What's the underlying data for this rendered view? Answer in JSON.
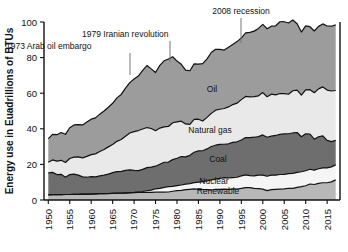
{
  "chart_data": {
    "type": "area",
    "stacked": true,
    "title": "",
    "xlabel": "",
    "ylabel": "Energy use in Euadrillions of BTUs",
    "xlim": [
      1949,
      2018
    ],
    "ylim": [
      0,
      100
    ],
    "yticks": [
      0,
      20,
      40,
      60,
      80,
      100
    ],
    "xticks": [
      1950,
      1955,
      1960,
      1965,
      1970,
      1975,
      1980,
      1985,
      1990,
      1995,
      2000,
      2005,
      2010,
      2015
    ],
    "grid": false,
    "legend_position": "inline-labels",
    "x": [
      1950,
      1951,
      1952,
      1953,
      1954,
      1955,
      1956,
      1957,
      1958,
      1959,
      1960,
      1961,
      1962,
      1963,
      1964,
      1965,
      1966,
      1967,
      1968,
      1969,
      1970,
      1971,
      1972,
      1973,
      1974,
      1975,
      1976,
      1977,
      1978,
      1979,
      1980,
      1981,
      1982,
      1983,
      1984,
      1985,
      1986,
      1987,
      1988,
      1989,
      1990,
      1991,
      1992,
      1993,
      1994,
      1995,
      1996,
      1997,
      1998,
      1999,
      2000,
      2001,
      2002,
      2003,
      2004,
      2005,
      2006,
      2007,
      2008,
      2009,
      2010,
      2011,
      2012,
      2013,
      2014,
      2015,
      2016,
      2017
    ],
    "series": [
      {
        "name": "Renewable",
        "color": "#b8b8b8",
        "values": [
          2.9,
          3.0,
          3.0,
          3.0,
          3.1,
          3.1,
          3.2,
          3.2,
          3.3,
          3.3,
          3.3,
          3.4,
          3.5,
          3.5,
          3.6,
          3.7,
          3.8,
          3.8,
          3.9,
          4.0,
          4.1,
          4.2,
          4.2,
          4.3,
          4.3,
          4.4,
          4.4,
          4.4,
          4.5,
          4.9,
          5.3,
          5.4,
          5.8,
          6.0,
          6.2,
          6.0,
          5.9,
          5.8,
          5.6,
          6.0,
          6.0,
          6.1,
          6.0,
          6.2,
          6.1,
          6.5,
          7.0,
          7.0,
          6.5,
          6.4,
          6.1,
          5.3,
          5.8,
          6.0,
          6.1,
          6.2,
          6.6,
          6.5,
          7.1,
          7.5,
          8.0,
          9.0,
          8.7,
          9.3,
          9.7,
          9.7,
          10.2,
          11.3
        ]
      },
      {
        "name": "Nuclear",
        "color": "#f5f5f5",
        "values": [
          0,
          0,
          0,
          0,
          0,
          0,
          0,
          0,
          0,
          0,
          0.01,
          0.02,
          0.03,
          0.04,
          0.04,
          0.04,
          0.06,
          0.09,
          0.14,
          0.15,
          0.24,
          0.41,
          0.58,
          0.91,
          1.27,
          1.9,
          2.11,
          2.7,
          3.02,
          2.78,
          2.74,
          3.01,
          3.13,
          3.2,
          3.55,
          4.08,
          4.47,
          4.91,
          5.66,
          5.68,
          6.1,
          6.42,
          6.48,
          6.41,
          6.69,
          7.08,
          7.09,
          6.68,
          7.07,
          7.61,
          7.86,
          8.03,
          8.15,
          7.96,
          8.23,
          8.16,
          8.21,
          8.46,
          8.43,
          8.36,
          8.43,
          8.26,
          8.06,
          8.24,
          8.33,
          8.34,
          8.43,
          8.42
        ]
      },
      {
        "name": "Coal",
        "color": "#6e6e6e",
        "values": [
          12.3,
          12.5,
          11.3,
          11.4,
          9.7,
          11.2,
          11.3,
          10.8,
          9.7,
          9.5,
          9.8,
          9.6,
          10.0,
          10.4,
          10.9,
          11.6,
          12.1,
          12.2,
          12.6,
          12.8,
          12.3,
          11.9,
          12.4,
          13.0,
          12.9,
          12.7,
          13.6,
          14.1,
          13.8,
          15.0,
          15.4,
          16.0,
          15.3,
          15.9,
          17.1,
          17.5,
          17.3,
          18.0,
          18.8,
          19.1,
          19.2,
          18.8,
          19.1,
          19.8,
          19.9,
          20.1,
          21.0,
          21.4,
          21.7,
          21.6,
          22.6,
          21.9,
          21.9,
          22.3,
          22.5,
          22.8,
          22.4,
          22.7,
          22.4,
          19.7,
          20.8,
          19.7,
          17.4,
          18.0,
          18.0,
          15.5,
          14.2,
          13.8
        ]
      },
      {
        "name": "Natural gas",
        "color": "#e9e9e9",
        "values": [
          6.0,
          7.0,
          7.5,
          7.9,
          8.3,
          9.0,
          9.6,
          10.2,
          10.7,
          11.7,
          12.4,
          12.9,
          13.7,
          14.4,
          15.3,
          15.8,
          17.0,
          17.9,
          19.2,
          20.7,
          21.8,
          22.5,
          22.7,
          22.5,
          21.7,
          19.9,
          20.3,
          19.9,
          20.0,
          20.7,
          20.4,
          19.9,
          18.5,
          17.4,
          18.5,
          17.8,
          16.7,
          17.7,
          18.6,
          19.7,
          19.7,
          20.1,
          20.7,
          21.2,
          21.7,
          22.7,
          23.1,
          22.9,
          22.8,
          22.9,
          23.8,
          22.8,
          23.6,
          22.8,
          23.0,
          22.6,
          22.2,
          23.7,
          23.8,
          23.4,
          24.6,
          25.0,
          26.1,
          26.9,
          27.5,
          28.2,
          28.4,
          28.0
        ]
      },
      {
        "name": "Oil",
        "color": "#9c9c9c",
        "values": [
          13.3,
          14.4,
          14.9,
          15.6,
          15.8,
          17.3,
          18.1,
          18.2,
          18.5,
          19.3,
          19.9,
          20.2,
          21.0,
          21.7,
          22.3,
          23.2,
          24.4,
          25.3,
          27.0,
          28.3,
          29.5,
          30.6,
          32.9,
          34.8,
          33.5,
          32.7,
          35.2,
          37.1,
          37.9,
          37.1,
          34.2,
          31.9,
          30.2,
          30.1,
          31.1,
          30.9,
          32.2,
          32.9,
          34.2,
          34.2,
          33.6,
          32.8,
          33.5,
          33.8,
          34.6,
          34.6,
          35.7,
          36.2,
          36.8,
          37.9,
          38.3,
          38.2,
          38.2,
          38.8,
          40.3,
          40.4,
          40.0,
          39.8,
          37.3,
          35.4,
          36.0,
          35.4,
          34.7,
          35.1,
          35.4,
          36.0,
          36.4,
          36.9
        ]
      }
    ],
    "series_labels": [
      {
        "name": "Oil",
        "x": 212,
        "y": 92
      },
      {
        "name": "Natural gas",
        "x": 210,
        "y": 133
      },
      {
        "name": "Coal",
        "x": 218,
        "y": 162
      },
      {
        "name": "Nuclear",
        "x": 214,
        "y": 184
      },
      {
        "name": "Renewable",
        "x": 218,
        "y": 194
      }
    ],
    "annotations": [
      {
        "text": "1973 Arab oil embargo",
        "label_x": 6,
        "label_y": 49,
        "anchor": "start",
        "line_x1": 130,
        "line_y1": 53,
        "line_x2": 130,
        "line_y2": 75
      },
      {
        "text": "1979 Iranian revolution",
        "label_x": 82,
        "label_y": 37,
        "anchor": "start",
        "line_x1": 170,
        "line_y1": 41,
        "line_x2": 170,
        "line_y2": 62
      },
      {
        "text": "2008 recession",
        "label_x": 241,
        "label_y": 14,
        "anchor": "middle",
        "line_x1": 241,
        "line_y1": 18,
        "line_x2": 241,
        "line_y2": 43
      }
    ]
  }
}
